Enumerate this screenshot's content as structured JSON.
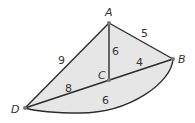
{
  "diagram": {
    "type": "geometry-figure",
    "fill_color": "#e6e6e6",
    "stroke_color": "#2b2b2b",
    "points": [
      {
        "id": "A",
        "label": "A",
        "x": 109,
        "y": 23
      },
      {
        "id": "B",
        "label": "B",
        "x": 173,
        "y": 59
      },
      {
        "id": "C",
        "label": "C",
        "x": 109,
        "y": 80
      },
      {
        "id": "D",
        "label": "D",
        "x": 25,
        "y": 108
      }
    ],
    "segments": [
      {
        "from": "A",
        "to": "D",
        "length": "9"
      },
      {
        "from": "A",
        "to": "B",
        "length": "5"
      },
      {
        "from": "A",
        "to": "C",
        "length": "6"
      },
      {
        "from": "C",
        "to": "B",
        "length": "4"
      },
      {
        "from": "D",
        "to": "C",
        "length": "8"
      }
    ],
    "arcs": [
      {
        "from": "D",
        "to": "B",
        "length": "6"
      }
    ]
  }
}
